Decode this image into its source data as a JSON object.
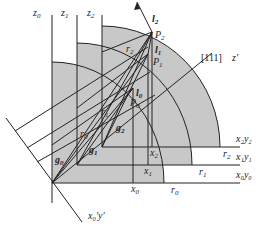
{
  "diagram": {
    "type": "geometric-projection",
    "colors": {
      "fill": "#c8c8c8",
      "line": "#222222",
      "background": "#ffffff"
    },
    "axis_labels": {
      "z0": {
        "base": "z",
        "sub": "0"
      },
      "z1": {
        "base": "z",
        "sub": "1"
      },
      "z2": {
        "base": "z",
        "sub": "2"
      },
      "zprime": "z′",
      "direction": "[111]",
      "x0y0": "x₀y₀",
      "x1y1": "x₁y₁",
      "x2y2": "x₂y₂",
      "x0y_prime": "x₀′y′"
    },
    "points": {
      "P0": {
        "base": "P",
        "sub": "0"
      },
      "P1": {
        "base": "P",
        "sub": "1"
      },
      "P2": {
        "base": "P",
        "sub": "2"
      }
    },
    "vectors": {
      "l0": {
        "base": "l",
        "sub": "0"
      },
      "l1": {
        "base": "l",
        "sub": "1"
      },
      "l2": {
        "base": "l",
        "sub": "2"
      },
      "g0": {
        "base": "g",
        "sub": "0"
      },
      "g1": {
        "base": "g",
        "sub": "1"
      },
      "g2": {
        "base": "g",
        "sub": "2"
      }
    },
    "radii": {
      "r0": {
        "base": "r",
        "sub": "0"
      },
      "r1": {
        "base": "r",
        "sub": "1"
      },
      "r2": {
        "base": "r",
        "sub": "2"
      }
    },
    "x_ticks": {
      "x0": {
        "base": "x",
        "sub": "0"
      },
      "x1": {
        "base": "x",
        "sub": "1"
      },
      "x2": {
        "base": "x",
        "sub": "2"
      }
    }
  }
}
